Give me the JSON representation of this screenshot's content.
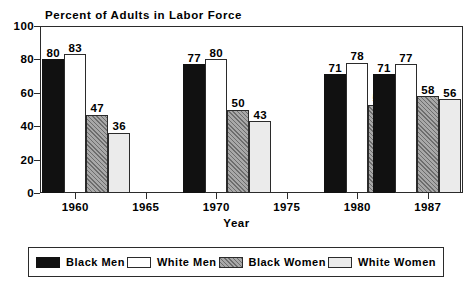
{
  "chart_data": {
    "type": "bar",
    "title": "Percent of Adults in Labor Force",
    "xlabel": "Year",
    "ylabel": "",
    "ylim": [
      0,
      100
    ],
    "yticks": [
      0,
      20,
      40,
      60,
      80,
      100
    ],
    "xticks": [
      "1960",
      "1965",
      "1970",
      "1975",
      "1980",
      "1987"
    ],
    "grid": false,
    "legend_position": "bottom",
    "categories": [
      "1960",
      "1970",
      "1980",
      "1987"
    ],
    "series": [
      {
        "name": "Black Men",
        "key": "black-men",
        "color": "#111111",
        "values": [
          80,
          77,
          71,
          71
        ]
      },
      {
        "name": "White Men",
        "key": "white-men",
        "color": "#ffffff",
        "values": [
          83,
          80,
          78,
          77
        ]
      },
      {
        "name": "Black Women",
        "key": "black-women",
        "color": "#a8a8a8",
        "values": [
          47,
          50,
          53,
          58
        ]
      },
      {
        "name": "White Women",
        "key": "white-women",
        "color": "#ebebeb",
        "values": [
          36,
          43,
          51,
          56
        ]
      }
    ]
  }
}
